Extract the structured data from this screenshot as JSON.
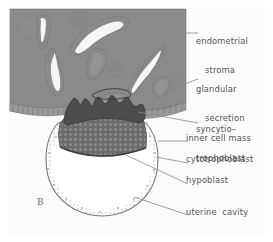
{
  "figure": {
    "panel_letter": "B",
    "title_text": "",
    "style": {
      "frame_border_color": "#4a4a4a",
      "page_background": "#ffffff",
      "panel_background": "#fbfbfb",
      "stroma_fill": "#8a8a8a",
      "stroma_edge": "#6f6f6f",
      "gland_lumen_fill": "#f4f4f4",
      "gland_outline": "#5e5e5e",
      "epithelium_fill": "#9a9a9a",
      "syncytiotrophoblast_fill": "#4d4d4d",
      "inner_cell_mass_fill": "#6b6b6b",
      "cytotrophoblast_stroke": "#7d7b7d",
      "cavity_fill": "#ffffff",
      "label_color": "#555356",
      "leader_color": "#8d8b8d"
    }
  },
  "labels": [
    {
      "id": "endometrial-stroma",
      "line1": "endometrial",
      "line2": "stroma",
      "x": 196,
      "y": 18
    },
    {
      "id": "glandular-secretion",
      "line1": "glandular",
      "line2": "secretion",
      "x": 196,
      "y": 66
    },
    {
      "id": "syncytiotrophoblast",
      "line1": "syncytio–",
      "line2": "trophoblast",
      "x": 196,
      "y": 106
    },
    {
      "id": "inner-cell-mass",
      "line1": "inner cell mass",
      "line2": "",
      "x": 186,
      "y": 134
    },
    {
      "id": "cytotrophoblast",
      "line1": "cytotrophoblast",
      "line2": "",
      "x": 186,
      "y": 155
    },
    {
      "id": "hypoblast",
      "line1": "hypoblast",
      "line2": "",
      "x": 186,
      "y": 176
    },
    {
      "id": "uterine-cavity",
      "line1": "uterine  cavity",
      "line2": "",
      "x": 186,
      "y": 208
    }
  ],
  "structures": {
    "endometrial_stroma": "Uterine endometrial stroma, shaded gray block occupying the upper portion of the panel",
    "uterine_glands": "Seven coiled endometrial glands with pale secretion-filled lumina outlined by dotted epithelium",
    "surface_epithelium": "Columnar surface epithelium along the lower margin of the stroma",
    "syncytiotrophoblast": "Dark, irregular invasive syncytiotrophoblast at the implantation site",
    "cytotrophoblast": "Thin cellular wall forming the blastocyst sphere",
    "inner_cell_mass": "Stippled cell cluster at the embryonic pole beneath the syncytiotrophoblast",
    "hypoblast": "Thin layer on the cavity-facing surface of the inner cell mass",
    "blastocyst_cavity": "Large pale cavity filling the blastocyst"
  }
}
